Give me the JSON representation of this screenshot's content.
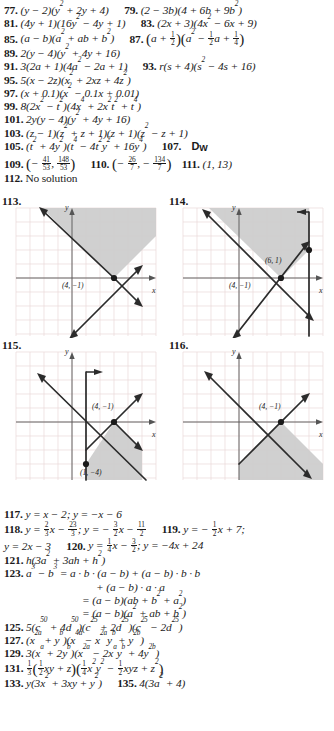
{
  "page": {
    "type": "textbook-answer-key",
    "colors": {
      "ink": "#1a1a1a",
      "grid": "#e9dcdc",
      "axis": "#555555",
      "shade": "#cfcfcf",
      "line": "#2b2b2b"
    }
  },
  "answers": [
    {
      "id": "77",
      "text": "(y − 2)(y² + 2y + 4)"
    },
    {
      "id": "79",
      "text": "(2 − 3b)(4 + 6b + 9b²)"
    },
    {
      "id": "81",
      "text": "(4y + 1)(16y² − 4y + 1)"
    },
    {
      "id": "83",
      "text": "(2x + 3)(4x² − 6x + 9)"
    },
    {
      "id": "85",
      "text": "(a − b)(a² + ab + b²)"
    },
    {
      "id": "87",
      "text": "(a + 1/2)(a² − 1/2 a + 1/4)"
    },
    {
      "id": "89",
      "text": "2(y − 4)(y² + 4y + 16)"
    },
    {
      "id": "91",
      "text": "3(2a + 1)(4a² − 2a + 1)"
    },
    {
      "id": "93",
      "text": "r(s + 4)(s² − 4s + 16)"
    },
    {
      "id": "95",
      "text": "5(x − 2z)(x² + 2xz + 4z²)"
    },
    {
      "id": "97",
      "text": "(x + 0.1)(x² − 0.1x + 0.01)"
    },
    {
      "id": "99",
      "text": "8(2x² − t²)(4x⁴ + 2x²t² + t⁴)"
    },
    {
      "id": "101",
      "text": "2y(y − 4)(y² + 4y + 16)"
    },
    {
      "id": "103",
      "text": "(z − 1)(z² + z + 1)(z + 1)(z² − z + 1)"
    },
    {
      "id": "105",
      "text": "(t² + 4y²)(t⁴ − 4t²y² + 16y⁴)"
    },
    {
      "id": "107",
      "text": "DW"
    },
    {
      "id": "109",
      "text": "(− 41/53 , 148/53)"
    },
    {
      "id": "110",
      "text": "(− 26/7 , − 134/7)"
    },
    {
      "id": "111",
      "text": "(1, 13)"
    },
    {
      "id": "112",
      "text": "No solution"
    },
    {
      "id": "117",
      "text": "y = x − 2;  y = −x − 6"
    },
    {
      "id": "118",
      "text": "y = 2/3 x − 23/3 ;  y = − 3/2 x − 11/2"
    },
    {
      "id": "119",
      "text": "y = − 1/2 x + 7;  y = 2x − 3"
    },
    {
      "id": "120",
      "text": "y = 1/4 x − 3/2 ;  y = −4x + 24"
    },
    {
      "id": "121",
      "text": "h(3a² + 3ah + h²)"
    },
    {
      "id": "123",
      "text": "a³ − b³ = a · b · (a − b) + (a − b) · b · b + (a − b) · a · a = (a − b)(ab + b² + a²) = (a − b)(a² + ab + b²)"
    },
    {
      "id": "125",
      "text": "5(c⁵⁰ + 4d⁵⁰)(c²⁵ + 2d²⁵)(c²⁵ − 2d²⁵)"
    },
    {
      "id": "127",
      "text": "(x²ᵃ + yᵇ)(x⁴ᵃ − x²ᵃyᵇ + y²ᵇ)"
    },
    {
      "id": "129",
      "text": "3(xᵃ + 2yᵇ)(x²ᵃ − 2xᵃyᵇ + 4y²ᵇ)"
    },
    {
      "id": "131",
      "text": "1/3 (1/2 xy + z)(1/4 x²y² − 1/2 xyz + z²)"
    },
    {
      "id": "133",
      "text": "y(3x² + 3xy + y²)"
    },
    {
      "id": "135",
      "text": "4(3a² + 4)"
    }
  ],
  "graphs": [
    {
      "id": "113",
      "number": "113.",
      "axis_x_label": "x",
      "axis_y_label": "y",
      "point_labels": [
        {
          "text": "(4, −1)",
          "x": 4,
          "y": -1
        }
      ],
      "description": "System of two linear inequalities; region above both lines shaded, vertex at (4, −1)."
    },
    {
      "id": "114",
      "number": "114.",
      "axis_x_label": "x",
      "axis_y_label": "y",
      "point_labels": [
        {
          "text": "(6, 1)",
          "x": 6,
          "y": 1
        },
        {
          "text": "(4, −1)",
          "x": 4,
          "y": -1
        }
      ],
      "description": "Three boundary lines including a vertical line x = 6; triangular shaded region with vertices (4, −1) and (6, 1)."
    },
    {
      "id": "115",
      "number": "115.",
      "axis_x_label": "x",
      "axis_y_label": "y",
      "point_labels": [
        {
          "text": "(4, −1)",
          "x": 4,
          "y": -1
        },
        {
          "text": "(1, −4)",
          "x": 1,
          "y": -4
        }
      ],
      "description": "Vertical boundary plus two lines; shaded wedge below the intersection at (4, −1) down to (1, −4)."
    },
    {
      "id": "116",
      "number": "116.",
      "axis_x_label": "x",
      "axis_y_label": "y",
      "point_labels": [
        {
          "text": "(4, −1)",
          "x": 4,
          "y": -1
        }
      ],
      "description": "Two lines crossing at (4, −1); region below both lines shaded."
    }
  ]
}
